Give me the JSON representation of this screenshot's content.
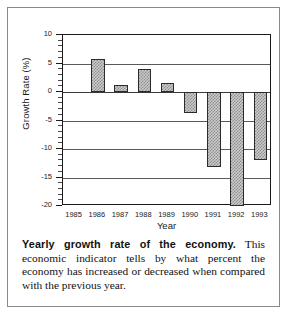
{
  "chart_data": {
    "type": "bar",
    "title": "",
    "xlabel": "Year",
    "ylabel": "Growth Rate (%)",
    "categories": [
      "1985",
      "1986",
      "1987",
      "1988",
      "1989",
      "1990",
      "1991",
      "1992",
      "1993"
    ],
    "values": [
      null,
      5.8,
      1.3,
      4.1,
      1.5,
      -3.6,
      -13.2,
      -20.0,
      -12.0
    ],
    "ylim": [
      -20,
      10
    ],
    "ytick_labels": [
      "10",
      "5",
      "0",
      "-5",
      "-10",
      "-15",
      "-20"
    ],
    "ytick_values": [
      10,
      5,
      0,
      -5,
      -10,
      -15,
      -20
    ],
    "yminor_step": 1,
    "grid": "horizontal",
    "legend": "none",
    "bar_fill": "gray-hatch",
    "bar_edge_color": "#2b2b2b",
    "axis_color": "#1a1a1a"
  },
  "caption": {
    "lead": "Yearly growth rate of the economy.",
    "body": " This economic indicator tells by what percent the economy has increased or decreased when compared with the previous year."
  }
}
